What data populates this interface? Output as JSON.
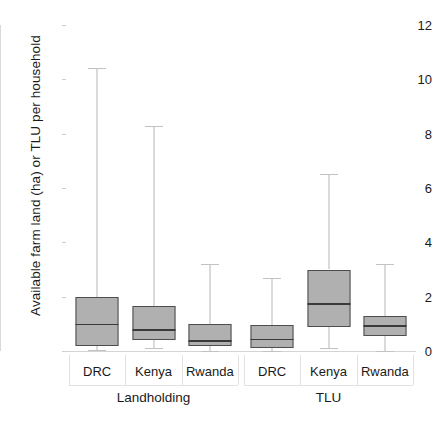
{
  "chart_data": {
    "type": "box",
    "title": "",
    "xlabel": "",
    "ylabel": "Available farm land (ha) or TLU per household",
    "ylim": [
      0,
      12
    ],
    "yticks": [
      0,
      2,
      4,
      6,
      8,
      10,
      12
    ],
    "grid": false,
    "legend": "none",
    "facets": [
      "Landholding",
      "TLU"
    ],
    "categories": [
      "DRC",
      "Kenya",
      "Rwanda"
    ],
    "boxes": [
      {
        "facet": "Landholding",
        "category": "DRC",
        "whisker_low": 0.05,
        "q1": 0.2,
        "median": 1.0,
        "q3": 2.0,
        "whisker_high": 10.4
      },
      {
        "facet": "Landholding",
        "category": "Kenya",
        "whisker_low": 0.1,
        "q1": 0.4,
        "median": 0.8,
        "q3": 1.65,
        "whisker_high": 8.3
      },
      {
        "facet": "Landholding",
        "category": "Rwanda",
        "whisker_low": 0.0,
        "q1": 0.2,
        "median": 0.4,
        "q3": 1.0,
        "whisker_high": 3.2
      },
      {
        "facet": "TLU",
        "category": "DRC",
        "whisker_low": 0.0,
        "q1": 0.1,
        "median": 0.45,
        "q3": 0.95,
        "whisker_high": 2.7
      },
      {
        "facet": "TLU",
        "category": "Kenya",
        "whisker_low": 0.1,
        "q1": 0.9,
        "median": 1.75,
        "q3": 3.0,
        "whisker_high": 6.5
      },
      {
        "facet": "TLU",
        "category": "Rwanda",
        "whisker_low": 0.0,
        "q1": 0.55,
        "median": 0.95,
        "q3": 1.3,
        "whisker_high": 3.2
      }
    ],
    "colors": {
      "box_fill": "#b0b0b0",
      "box_border": "#4d4d4d",
      "median": "#3a3a3a",
      "whisker": "#b6b6b6",
      "axis": "#d4d4d4",
      "text": "#1a1a1a",
      "background": "#ffffff"
    }
  }
}
